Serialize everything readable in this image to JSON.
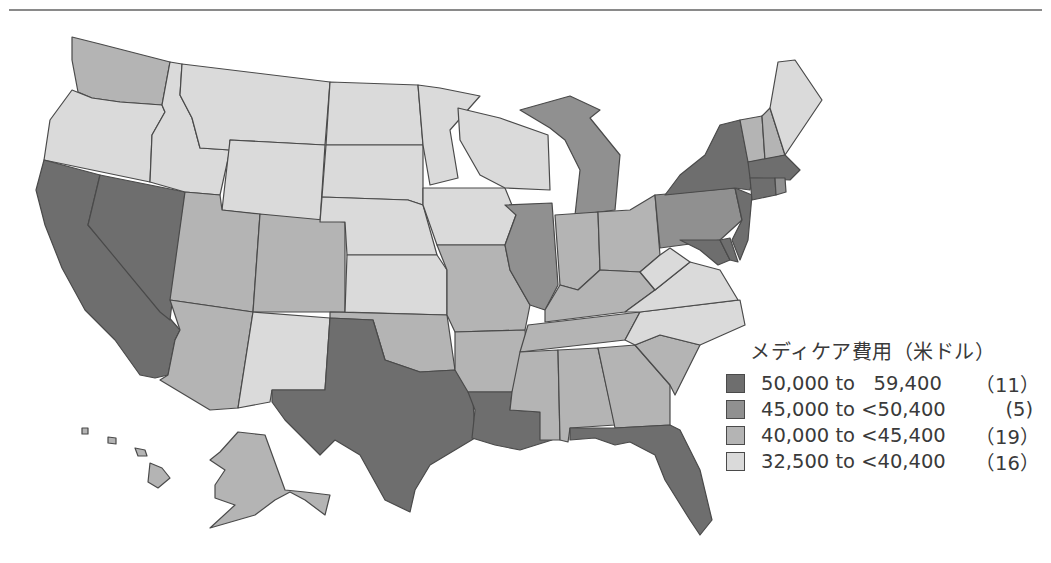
{
  "legend": {
    "title": "メディケア費用（米ドル）",
    "items": [
      {
        "range": "50,000 to   59,400",
        "count": "（11）",
        "color": "#6e6e6e"
      },
      {
        "range": "45,000 to <50,400",
        "count": "(5)",
        "color": "#909090"
      },
      {
        "range": "40,000 to <45,400",
        "count": "（19）",
        "color": "#b4b4b4"
      },
      {
        "range": "32,500 to <40,400",
        "count": "（16）",
        "color": "#dadada"
      }
    ]
  },
  "map": {
    "title": "US states choropleth — Medicare cost",
    "classes": {
      "c1": "#6e6e6e",
      "c2": "#909090",
      "c3": "#b4b4b4",
      "c4": "#dadada"
    },
    "states": {
      "c1": [
        "California",
        "Nevada",
        "Texas",
        "Louisiana",
        "Florida",
        "New York",
        "New Jersey",
        "Massachusetts",
        "Connecticut",
        "Maryland",
        "Delaware"
      ],
      "c2": [
        "Michigan",
        "Illinois",
        "Pennsylvania",
        "Rhode Island",
        "Washington DC"
      ],
      "c3": [
        "Washington",
        "Utah",
        "Colorado",
        "Arizona",
        "Oklahoma",
        "Missouri",
        "Arkansas",
        "Indiana",
        "Ohio",
        "Kentucky",
        "Tennessee",
        "Mississippi",
        "Alabama",
        "Georgia",
        "South Carolina",
        "New Hampshire",
        "Vermont",
        "Alaska",
        "Hawaii"
      ],
      "c4": [
        "Oregon",
        "Idaho",
        "Montana",
        "Wyoming",
        "North Dakota",
        "South Dakota",
        "Nebraska",
        "Kansas",
        "Minnesota",
        "Iowa",
        "Wisconsin",
        "New Mexico",
        "West Virginia",
        "Virginia",
        "North Carolina",
        "Maine"
      ]
    }
  }
}
